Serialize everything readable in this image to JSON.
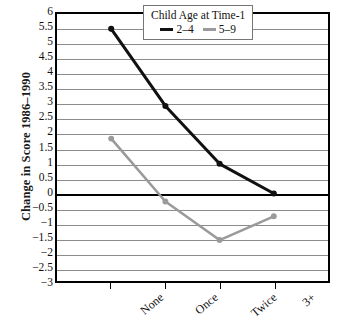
{
  "chart_data": {
    "type": "line",
    "title": "",
    "xlabel": "",
    "ylabel": "Change in Score 1986–1990",
    "categories": [
      "None",
      "Once",
      "Twice",
      "3+"
    ],
    "series": [
      {
        "name": "2–4",
        "color": "#111111",
        "values": [
          5.5,
          2.9,
          0.95,
          -0.05
        ]
      },
      {
        "name": "5–9",
        "color": "#9a9a9a",
        "values": [
          1.8,
          -0.32,
          -1.62,
          -0.82
        ]
      }
    ],
    "ylim": [
      -3,
      6
    ],
    "ytick_step": 0.5,
    "ytick_labels": [
      "6",
      "5.5",
      "5",
      "4.5",
      "4",
      "3.5",
      "3",
      "2.5",
      "2",
      "1.5",
      "1",
      "0.5",
      "0",
      "−0.5",
      "−1",
      "−1.5",
      "−2",
      "−2.5",
      "−3"
    ],
    "grid": true,
    "zero_line_emphasis": true,
    "legend_position": "top-right",
    "legend": {
      "title": "Child Age at Time-1",
      "entries": [
        {
          "label": "2–4",
          "color": "#111111"
        },
        {
          "label": "5–9",
          "color": "#9a9a9a"
        }
      ]
    }
  }
}
